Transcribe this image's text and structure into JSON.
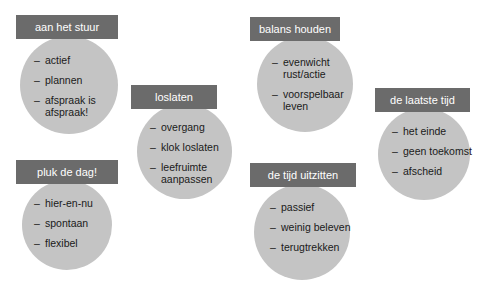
{
  "groups": [
    {
      "title": "aan het stuur",
      "items": [
        "actief",
        "plannen",
        "afspraak is afspraak!"
      ]
    },
    {
      "title": "loslaten",
      "items": [
        "overgang",
        "klok loslaten",
        "leefruimte aanpassen"
      ]
    },
    {
      "title": "balans houden",
      "items": [
        "evenwicht rust/actie",
        "voorspelbaar leven"
      ]
    },
    {
      "title": "de laatste tijd",
      "items": [
        "het einde",
        "geen toekomst",
        "afscheid"
      ]
    },
    {
      "title": "pluk de dag!",
      "items": [
        "hier-en-nu",
        "spontaan",
        "flexibel"
      ]
    },
    {
      "title": "de tijd uitzitten",
      "items": [
        "passief",
        "weinig beleven",
        "terugtrekken"
      ]
    }
  ],
  "colors": {
    "label_bg": "#6b6b6b",
    "label_text": "#ffffff",
    "circle_bg": "#c4c4c4",
    "item_text": "#1a1a1a"
  }
}
